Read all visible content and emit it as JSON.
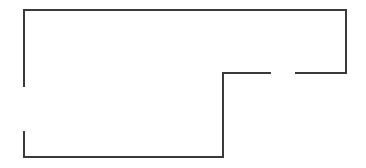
{
  "diagram": {
    "type": "floor-plan-outline",
    "background": "#ffffff",
    "stroke_color": "#3a3a3a",
    "stroke_width": 2,
    "walls": [
      {
        "name": "top-wall",
        "x1": 24,
        "y1": 10,
        "x2": 346,
        "y2": 10
      },
      {
        "name": "right-wall",
        "x1": 346,
        "y1": 10,
        "x2": 346,
        "y2": 73
      },
      {
        "name": "middle-wall-right-segment",
        "x1": 346,
        "y1": 73,
        "x2": 296,
        "y2": 73
      },
      {
        "name": "middle-wall-left-segment",
        "x1": 270,
        "y1": 73,
        "x2": 223,
        "y2": 73
      },
      {
        "name": "inner-vertical-wall",
        "x1": 223,
        "y1": 73,
        "x2": 223,
        "y2": 157
      },
      {
        "name": "bottom-wall",
        "x1": 223,
        "y1": 157,
        "x2": 24,
        "y2": 157
      },
      {
        "name": "left-wall-lower-segment",
        "x1": 24,
        "y1": 157,
        "x2": 24,
        "y2": 132
      },
      {
        "name": "left-wall-upper-segment",
        "x1": 24,
        "y1": 86,
        "x2": 24,
        "y2": 10
      }
    ],
    "openings": [
      {
        "name": "left-doorway",
        "x": 24,
        "y_start": 86,
        "y_end": 132
      },
      {
        "name": "middle-doorway",
        "y": 73,
        "x_start": 270,
        "x_end": 296
      }
    ]
  }
}
